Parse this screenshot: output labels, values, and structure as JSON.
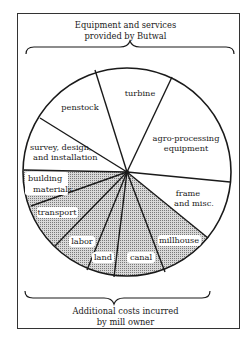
{
  "top_caption": {
    "line1": "Equipment and services",
    "line2": "provided by Butwal"
  },
  "bottom_caption": {
    "line1": "Additional costs incurred",
    "line2": "by mill owner"
  },
  "colors": {
    "line": "#1a1a1a",
    "shaded_fill": "#bdbdbd",
    "unshaded_fill": "#ffffff"
  },
  "segments": [
    {
      "label": "turbine",
      "group": "butwal"
    },
    {
      "label": "agro-processing equipment",
      "group": "butwal"
    },
    {
      "label": "frame and misc.",
      "group": "butwal"
    },
    {
      "label": "millhouse",
      "group": "owner"
    },
    {
      "label": "canal",
      "group": "owner"
    },
    {
      "label": "land",
      "group": "owner"
    },
    {
      "label": "labor",
      "group": "owner"
    },
    {
      "label": "transport",
      "group": "owner"
    },
    {
      "label": "building materials",
      "group": "owner"
    },
    {
      "label": "survey, design, and installation",
      "group": "butwal"
    },
    {
      "label": "penstock",
      "group": "butwal"
    }
  ],
  "labels": {
    "turbine": "turbine",
    "agro1": "agro-processing",
    "agro2": "equipment",
    "frame1": "frame",
    "frame2": "and misc.",
    "millhouse": "millhouse",
    "canal": "canal",
    "land": "land",
    "labor": "labor",
    "transport": "transport",
    "building1": "building",
    "building2": "materials",
    "survey1": "survey, design,",
    "survey2": "and installation",
    "penstock": "penstock"
  }
}
